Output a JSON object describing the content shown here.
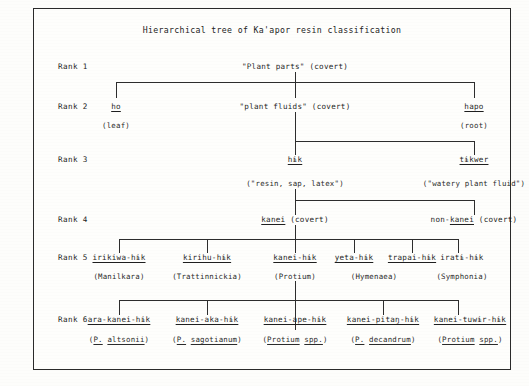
{
  "figure": {
    "title": "Hierarchical tree of Ka'apor resin classification"
  },
  "rank_labels": [
    {
      "label": "Rank 1"
    },
    {
      "label": "Rank 2"
    },
    {
      "label": "Rank 3"
    },
    {
      "label": "Rank 4"
    },
    {
      "label": "Rank 5"
    },
    {
      "label": "Rank 6"
    }
  ],
  "rank1": {
    "nodes": [
      {
        "name": "\"Plant parts\" (covert)"
      }
    ]
  },
  "rank2": {
    "nodes": [
      {
        "name": "ho",
        "gloss": "(leaf)"
      },
      {
        "name": "\"plant fluids\" (covert)",
        "gloss": ""
      },
      {
        "name": "hapo",
        "gloss": "(root)"
      }
    ]
  },
  "rank3": {
    "nodes": [
      {
        "name": "hɨk",
        "gloss": "(\"resin, sap, latex\")"
      },
      {
        "name": "tɨkwer",
        "gloss": "(\"watery plant fluid\")"
      }
    ]
  },
  "rank4": {
    "nodes": [
      {
        "name_underlined": "kanei",
        "name_rest": " (covert)"
      },
      {
        "name_prefix": "non-",
        "name_underlined": "kanei",
        "name_rest": " (covert)"
      }
    ]
  },
  "rank5": {
    "nodes": [
      {
        "name": "irikiwa-hɨk",
        "gloss": "(Manilkara)"
      },
      {
        "name": "kirihu-hɨk",
        "gloss": "(Trattinnickia)"
      },
      {
        "name": "kanei-hɨk",
        "gloss": "(Protium)"
      },
      {
        "name": "yeta-hɨk",
        "gloss": "(Hymenaea)"
      },
      {
        "name": "trapai-hɨk",
        "gloss": ""
      },
      {
        "name": "iratɨ-hɨk",
        "gloss": "(Symphonia)"
      }
    ]
  },
  "rank6": {
    "nodes": [
      {
        "name": "ara-kanei-hɨk",
        "gloss_abbr": "P.",
        "gloss_sp": "altsonii"
      },
      {
        "name": "kanei-aka-hɨk",
        "gloss_abbr": "P.",
        "gloss_sp": "sagotianum"
      },
      {
        "name": "kanei-ape-hɨk",
        "gloss_abbr": "Protium",
        "gloss_sp": "spp."
      },
      {
        "name": "kanei-pitaŋ-hɨk",
        "gloss_abbr": "P.",
        "gloss_sp": "decandrum"
      },
      {
        "name": "kanei-tuwɨr-hɨk",
        "gloss_abbr": "Protium",
        "gloss_sp": "spp."
      }
    ]
  },
  "colors": {
    "ink": "#232323",
    "rule": "#2d2d2d",
    "paper": "#fefefc",
    "border": "#2a2a2a"
  }
}
